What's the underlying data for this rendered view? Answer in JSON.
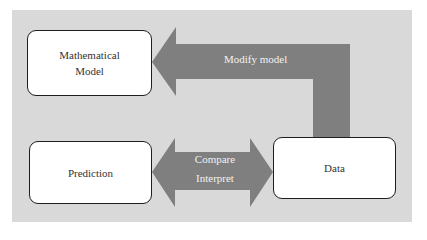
{
  "diagram": {
    "nodes": [
      {
        "id": "mathematical-model",
        "label_line1": "Mathematical",
        "label_line2": "Model"
      },
      {
        "id": "prediction",
        "label": "Prediction"
      },
      {
        "id": "data",
        "label": "Data"
      }
    ],
    "edges": [
      {
        "from": "data",
        "to": "mathematical-model",
        "label": "Modify model",
        "direction": "single"
      },
      {
        "from": "prediction",
        "to": "data",
        "label_line1": "Compare",
        "label_line2": "Interpret",
        "direction": "double"
      }
    ],
    "colors": {
      "background": "#d9d9d9",
      "arrow": "#7f7f7f",
      "box_fill": "#ffffff",
      "box_border": "#1e1e1e",
      "arrow_text": "#f2f2f2"
    }
  }
}
